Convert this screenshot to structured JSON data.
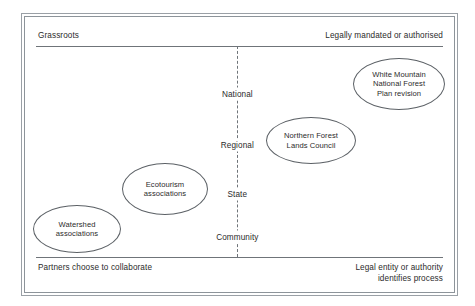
{
  "diagram": {
    "background_color": "#ffffff",
    "frame_color": "#9aa0a6",
    "line_color": "#6f7479",
    "text_color": "#2b2b2b",
    "corner_labels": {
      "top_left": "Grassroots",
      "top_right": "Legally mandated or authorised",
      "bottom_left": "Partners choose to collaborate",
      "bottom_right": "Legal entity or authority\nidentifies process"
    },
    "axis": {
      "orientation": "vertical",
      "style": "dashed",
      "scale_labels": [
        {
          "label": "National",
          "x_pct": 49.5,
          "y_pct": 28.0
        },
        {
          "label": "Regional",
          "x_pct": 49.5,
          "y_pct": 46.5
        },
        {
          "label": "State",
          "x_pct": 49.5,
          "y_pct": 64.5
        },
        {
          "label": "Community",
          "x_pct": 49.5,
          "y_pct": 80.0
        }
      ]
    },
    "nodes": [
      {
        "name": "white-mountain-national-forest-plan-revision",
        "text": "White Mountain\nNational Forest\nPlan revision",
        "left": 328,
        "top": 41,
        "width": 92,
        "height": 52
      },
      {
        "name": "northern-forest-lands-council",
        "text": "Northern Forest\nLands Council",
        "left": 241,
        "top": 100,
        "width": 90,
        "height": 47
      },
      {
        "name": "ecotourism-associations",
        "text": "Ecotourism\nassociations",
        "left": 97,
        "top": 146,
        "width": 86,
        "height": 52
      },
      {
        "name": "watershed-associations",
        "text": "Watershed\nassociations",
        "left": 8,
        "top": 188,
        "width": 88,
        "height": 48
      }
    ]
  }
}
